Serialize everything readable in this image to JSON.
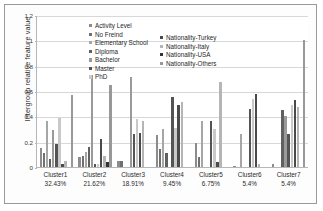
{
  "chart_data": {
    "type": "bar",
    "title": "",
    "xlabel": "",
    "ylabel": "Intergroup relative feature value",
    "ylim": [
      0,
      1.2
    ],
    "yticks": [
      "0",
      "0.2",
      "0.4",
      "0.6",
      "0.8",
      "1",
      "1.2"
    ],
    "grid": true,
    "legend_position": "inside-top-center",
    "categories": [
      "Cluster1",
      "Cluster2",
      "Cluster3",
      "Cluster4",
      "Cluster5",
      "Cluster6",
      "Cluster7"
    ],
    "category_percents": [
      "32.43%",
      "21.62%",
      "18.91%",
      "9.45%",
      "6.75%",
      "5.4%",
      "5.4%"
    ],
    "series": [
      {
        "name": "Activity Level",
        "color": "#8c8c8c",
        "values": [
          0.15,
          0.08,
          0.05,
          0.25,
          0.19,
          0.01,
          0.02
        ]
      },
      {
        "name": "No Freind",
        "color": "#707070",
        "values": [
          0.11,
          0.09,
          0.05,
          0.14,
          0.08,
          0.0,
          0.0
        ]
      },
      {
        "name": "Elementary School",
        "color": "#a6a6a6",
        "values": [
          0.36,
          0.12,
          0.0,
          0.3,
          0.36,
          0.26,
          0.0
        ]
      },
      {
        "name": "Diploma",
        "color": "#606060",
        "values": [
          0.06,
          0.16,
          0.0,
          0.11,
          0.0,
          0.0,
          0.45
        ]
      },
      {
        "name": "Bachelor",
        "color": "#9a9a9a",
        "values": [
          0.29,
          0.73,
          0.71,
          0.0,
          0.0,
          0.0,
          0.4
        ]
      },
      {
        "name": "Master",
        "color": "#545454",
        "values": [
          0.18,
          0.02,
          0.26,
          0.55,
          0.36,
          0.46,
          0.26
        ]
      },
      {
        "name": "PhD",
        "color": "#c9c9c9",
        "values": [
          0.39,
          0.02,
          0.38,
          0.31,
          0.3,
          0.54,
          0.49
        ]
      },
      {
        "name": "Nationality-Turkey",
        "color": "#4a4a4a",
        "values": [
          0.02,
          0.22,
          0.27,
          0.49,
          0.04,
          0.58,
          0.53
        ]
      },
      {
        "name": "Nationality-Italy",
        "color": "#b5b5b5",
        "values": [
          0.05,
          0.09,
          0.36,
          0.51,
          0.67,
          0.02,
          0.47
        ]
      },
      {
        "name": "Nationality-USA",
        "color": "#333333",
        "values": [
          0.0,
          0.04,
          0.0,
          0.0,
          0.0,
          0.0,
          0.0
        ]
      },
      {
        "name": "Nationality-Others",
        "color": "#989898",
        "values": [
          0.57,
          0.65,
          0.0,
          0.0,
          0.0,
          0.0,
          1.0
        ]
      }
    ]
  },
  "legend": {
    "column_1": [
      "Activity Level",
      "No Freind",
      "Elementary School",
      "Diploma",
      "Bachelor",
      "Master",
      "PhD"
    ],
    "column_2": [
      "Nationality-Turkey",
      "Nationality-Italy",
      "Nationality-USA",
      "Nationality-Others"
    ]
  }
}
